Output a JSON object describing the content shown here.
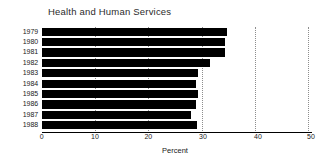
{
  "chart_data": {
    "type": "bar",
    "orientation": "horizontal",
    "title": "Health and Human Services",
    "xlabel": "Percent",
    "ylabel": "",
    "categories": [
      "1979",
      "1980",
      "1981",
      "1982",
      "1983",
      "1984",
      "1985",
      "1986",
      "1987",
      "1988"
    ],
    "values": [
      34.3,
      33.9,
      33.9,
      31.2,
      28.9,
      28.5,
      29.0,
      28.5,
      27.6,
      28.8
    ],
    "xlim": [
      0,
      50
    ],
    "xticks": [
      0,
      10,
      20,
      30,
      40,
      50
    ],
    "xtick_labels": [
      "0",
      "10",
      "20",
      "30",
      "40",
      "50"
    ],
    "grid": true,
    "grid_axis": "x",
    "grid_style": "dotted",
    "legend": false,
    "bar_color": "#000000",
    "axis_color": "#000000",
    "grid_color": "#8d8d8d"
  }
}
